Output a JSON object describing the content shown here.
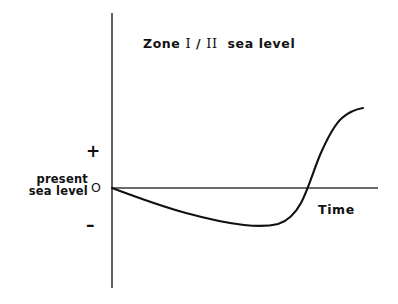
{
  "figure": {
    "title_parts": {
      "zone_word": "Zone",
      "numeral_one": "І",
      "slash": "/",
      "numeral_two": "ІІ",
      "sea_level": "sea  level"
    },
    "background_color": "#ffffff",
    "curve_color": "#111111",
    "axis_color": "#3a3a3a"
  },
  "axes": {
    "y_axis": {
      "name": "sea level",
      "ticks": [
        {
          "label": "+",
          "meaning": "above present sea level"
        },
        {
          "label": "O",
          "meaning": "present sea level (zero)"
        },
        {
          "label": "–",
          "meaning": "below present sea level"
        }
      ],
      "origin_label_line1": "present",
      "origin_label_line2": "sea level"
    },
    "x_axis": {
      "label": "Time",
      "ticks": []
    }
  },
  "chart_data": {
    "type": "line",
    "xlabel": "Time",
    "ylabel": "",
    "grid": false,
    "legend": null,
    "xlim": [
      0,
      1
    ],
    "ylim": [
      -1,
      1
    ],
    "annotations": [
      {
        "text": "+",
        "x": -0.07,
        "y": 0.52
      },
      {
        "text": "O",
        "x": -0.03,
        "y": 0.0
      },
      {
        "text": "–",
        "x": -0.07,
        "y": -0.48
      },
      {
        "text": "present sea level",
        "x": -0.22,
        "y": 0.0
      },
      {
        "text": "Time",
        "x": 0.78,
        "y": -0.2
      }
    ],
    "series": [
      {
        "name": "relative sea level",
        "x": [
          0.0,
          0.08,
          0.16,
          0.24,
          0.32,
          0.4,
          0.47,
          0.55,
          0.62,
          0.68,
          0.72,
          0.76,
          0.8,
          0.84,
          0.88,
          0.92,
          0.96,
          1.0
        ],
        "y": [
          0.0,
          -0.13,
          -0.24,
          -0.33,
          -0.4,
          -0.45,
          -0.48,
          -0.49,
          -0.47,
          -0.4,
          -0.32,
          -0.2,
          -0.05,
          0.14,
          0.33,
          0.49,
          0.6,
          0.68
        ]
      }
    ]
  },
  "curve_path": "M 112,188 C 136,197 160,206 186,213 C 208,219 226,223 244,225 C 258,226.5 268,226.5 278,224 C 288,221 295,214 301,203 C 308,190 313,172 320,155 C 327,139 334,125 342,118 C 350,111 357,109 363,108",
  "geometry": {
    "y_axis_x": 112,
    "y_axis_top": 13,
    "y_axis_bottom": 288,
    "x_axis_y": 188,
    "x_axis_left": 112,
    "x_axis_right": 378
  }
}
